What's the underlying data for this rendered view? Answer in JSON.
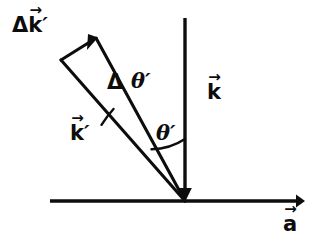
{
  "figure": {
    "background_color": "#ffffff",
    "stroke_color": "#0d0d0d",
    "origin": {
      "x": 185,
      "y": 201
    },
    "labels": {
      "delta_k_prime": {
        "symbol": "k",
        "prefix": "Δ",
        "prime": "′",
        "accent": "→",
        "text": "Δk⃗′"
      },
      "delta_theta_prime_delta": {
        "text": "Δ"
      },
      "delta_theta_prime_theta": {
        "symbol": "θ",
        "prime": "′",
        "text": "θ′"
      },
      "k_prime": {
        "symbol": "k",
        "prime": "′",
        "accent": "→",
        "text": "k⃗′"
      },
      "theta_prime": {
        "symbol": "θ",
        "prime": "′",
        "text": "θ′"
      },
      "k": {
        "symbol": "k",
        "accent": "→",
        "text": "k⃗"
      },
      "a": {
        "symbol": "a",
        "accent": "→",
        "text": "a⃗"
      }
    },
    "elements": {
      "horizontal_axis": {
        "name": "a-axis",
        "from": [
          50,
          201
        ],
        "to": [
          303,
          201
        ],
        "arrow": "end"
      },
      "vertical_axis": {
        "name": "k-vector",
        "from": [
          185,
          18
        ],
        "to": [
          185,
          201
        ],
        "arrow": "end"
      },
      "wedge_left_edge": {
        "from": [
          185,
          201
        ],
        "to": [
          61,
          60
        ]
      },
      "wedge_right_edge": {
        "from": [
          185,
          201
        ],
        "to": [
          96,
          38
        ]
      },
      "delta_k_arrow": {
        "from": [
          61,
          60
        ],
        "to": [
          96,
          38
        ],
        "arrow": "end"
      },
      "arc_delta_theta": {
        "center": [
          185,
          201
        ],
        "radius": 122
      },
      "arc_theta": {
        "center": [
          185,
          201
        ],
        "radius": 62
      }
    }
  }
}
